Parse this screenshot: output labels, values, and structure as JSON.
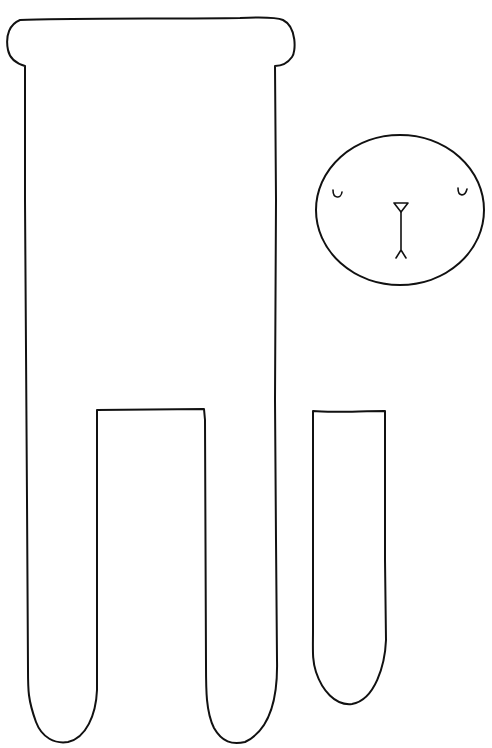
{
  "figure": {
    "description": "Hand-drawn sewing/craft pattern template: tall rectangular body with rounded top cap and two legs, a round face piece, and a separate arm piece",
    "stroke_color": "#111111",
    "background_color": "#ffffff",
    "pieces": [
      {
        "name": "body",
        "label": "Body piece with two legs"
      },
      {
        "name": "head",
        "label": "Round head with closed eyes, nose and mouth"
      },
      {
        "name": "arm",
        "label": "Separate arm piece"
      }
    ]
  }
}
